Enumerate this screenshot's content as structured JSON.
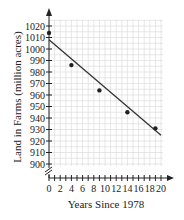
{
  "chart_data": {
    "type": "scatter",
    "title": "",
    "xlabel": "Years Since 1978",
    "ylabel": "Land in Farms (million acres)",
    "xlim": [
      0,
      20
    ],
    "ylim": [
      900,
      1020
    ],
    "y_axis_break": true,
    "grid": true,
    "x_ticks": [
      0,
      2,
      4,
      6,
      8,
      10,
      12,
      14,
      16,
      18,
      20
    ],
    "y_ticks": [
      900,
      910,
      920,
      930,
      940,
      950,
      960,
      970,
      980,
      990,
      1000,
      1010,
      1020
    ],
    "series": [
      {
        "name": "Data points",
        "type": "scatter",
        "x": [
          0,
          4,
          9,
          14,
          19
        ],
        "y": [
          1014,
          986,
          964,
          945,
          931
        ]
      },
      {
        "name": "Trend line",
        "type": "line",
        "x": [
          0,
          20
        ],
        "y": [
          1008,
          925
        ]
      }
    ]
  },
  "labels": {
    "xlabel": "Years Since 1978",
    "ylabel": "Land in Farms (million acres)"
  }
}
